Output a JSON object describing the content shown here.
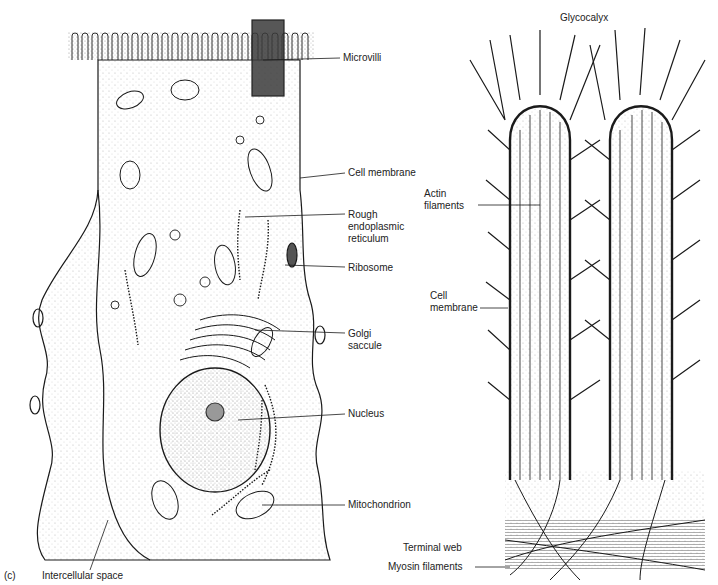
{
  "figure": {
    "panel_letter": "(c)",
    "left_panel": {
      "title": "Epithelial cell with microvilli",
      "labels": {
        "microvilli": "Microvilli",
        "cell_membrane": "Cell membrane",
        "rer_line1": "Rough",
        "rer_line2": "endoplasmic",
        "rer_line3": "reticulum",
        "ribosome": "Ribosome",
        "golgi_line1": "Golgi",
        "golgi_line2": "saccule",
        "nucleus": "Nucleus",
        "mitochondrion": "Mitochondrion",
        "intercellular_space": "Intercellular space"
      }
    },
    "right_panel": {
      "title": "Microvilli detail",
      "labels": {
        "glycocalyx": "Glycocalyx",
        "actin_line1": "Actin",
        "actin_line2": "filaments",
        "cell_membrane_line1": "Cell",
        "cell_membrane_line2": "membrane",
        "terminal_web": "Terminal web",
        "myosin_filaments": "Myosin filaments"
      }
    },
    "colors": {
      "ink": "#1a1a1a",
      "stipple": "#c8c8c8",
      "highlight_box": "#3a3a3a"
    }
  }
}
